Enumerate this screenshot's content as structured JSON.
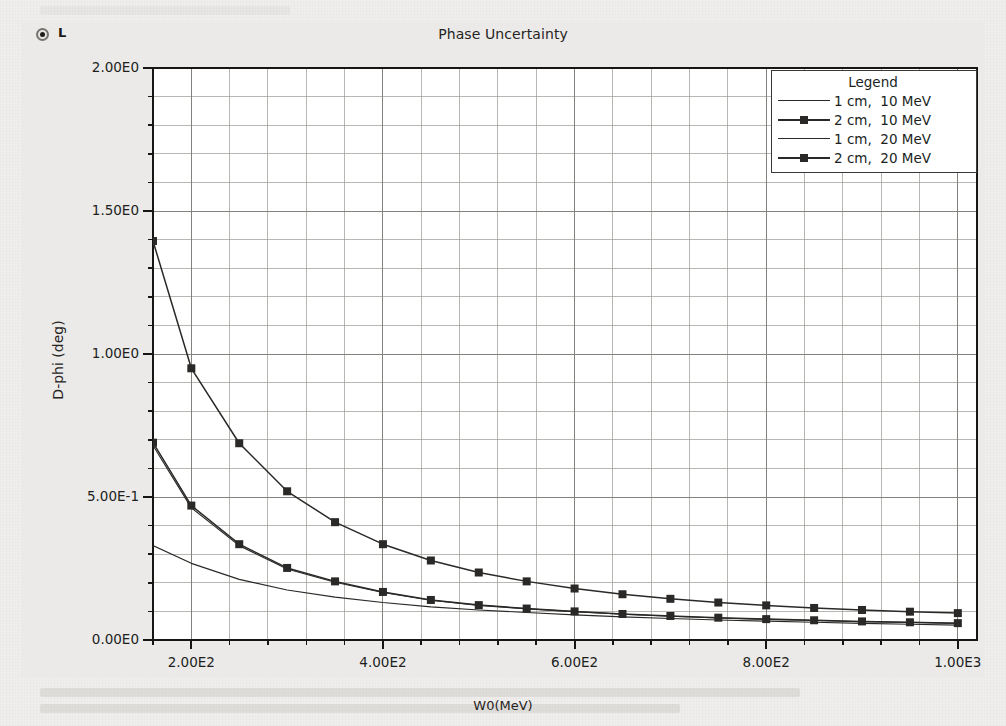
{
  "header": {
    "radio_label": "L",
    "radio_icon": "radio-selected-icon",
    "title": "Phase Uncertainty"
  },
  "chart_data": {
    "type": "line",
    "title": "Phase Uncertainty",
    "xlabel": "W0(MeV)",
    "ylabel": "D-phi (deg)",
    "xlim": [
      160,
      1020
    ],
    "ylim": [
      0.0,
      2.0
    ],
    "grid": true,
    "legend_position": "top-right",
    "legend_title": "Legend",
    "x_ticks": [
      {
        "value": 200,
        "label": "2.00E2"
      },
      {
        "value": 400,
        "label": "4.00E2"
      },
      {
        "value": 600,
        "label": "6.00E2"
      },
      {
        "value": 800,
        "label": "8.00E2"
      },
      {
        "value": 1000,
        "label": "1.00E3"
      }
    ],
    "y_ticks": [
      {
        "value": 2.0,
        "label": "2.00E0"
      },
      {
        "value": 1.5,
        "label": "1.50E0"
      },
      {
        "value": 1.0,
        "label": "1.00E0"
      },
      {
        "value": 0.5,
        "label": "5.00E-1"
      },
      {
        "value": 0.0,
        "label": "0.00E0"
      }
    ],
    "x_minor_step": 40,
    "y_minor_step": 0.1,
    "series": [
      {
        "name": "1 cm,  10 MeV",
        "style": "line",
        "markers": false,
        "x": [
          160,
          200,
          250,
          300,
          350,
          400,
          450,
          500,
          550,
          600,
          650,
          700,
          750,
          800,
          850,
          900,
          950,
          1000
        ],
        "y": [
          0.33,
          0.268,
          0.212,
          0.175,
          0.15,
          0.131,
          0.116,
          0.105,
          0.096,
          0.088,
          0.081,
          0.075,
          0.07,
          0.066,
          0.062,
          0.058,
          0.055,
          0.052
        ]
      },
      {
        "name": "2 cm,  10 MeV",
        "style": "line-marker",
        "markers": true,
        "x": [
          160,
          200,
          250,
          300,
          350,
          400,
          450,
          500,
          550,
          600,
          650,
          700,
          750,
          800,
          850,
          900,
          950,
          1000
        ],
        "y": [
          0.69,
          0.47,
          0.335,
          0.252,
          0.205,
          0.168,
          0.14,
          0.122,
          0.11,
          0.1,
          0.091,
          0.084,
          0.078,
          0.073,
          0.069,
          0.065,
          0.062,
          0.059
        ]
      },
      {
        "name": "1 cm,  20 MeV",
        "style": "line",
        "markers": false,
        "x": [
          160,
          200,
          250,
          300,
          350,
          400,
          450,
          500,
          550,
          600,
          650,
          700,
          750,
          800,
          850,
          900,
          950,
          1000
        ],
        "y": [
          0.68,
          0.462,
          0.33,
          0.248,
          0.202,
          0.166,
          0.139,
          0.121,
          0.109,
          0.099,
          0.09,
          0.083,
          0.077,
          0.072,
          0.068,
          0.064,
          0.061,
          0.058
        ]
      },
      {
        "name": "2 cm,  20 MeV",
        "style": "line-marker",
        "markers": true,
        "x": [
          160,
          200,
          250,
          300,
          350,
          400,
          450,
          500,
          550,
          600,
          650,
          700,
          750,
          800,
          850,
          900,
          950,
          1000
        ],
        "y": [
          1.395,
          0.95,
          0.688,
          0.52,
          0.412,
          0.335,
          0.278,
          0.236,
          0.205,
          0.18,
          0.16,
          0.144,
          0.131,
          0.121,
          0.112,
          0.105,
          0.099,
          0.094
        ]
      }
    ]
  },
  "colors": {
    "line": "#2a2927",
    "grid": "#9a9894",
    "axis": "#171615",
    "plot_bg": "#ffffff",
    "window_bg": "#eceae8"
  }
}
